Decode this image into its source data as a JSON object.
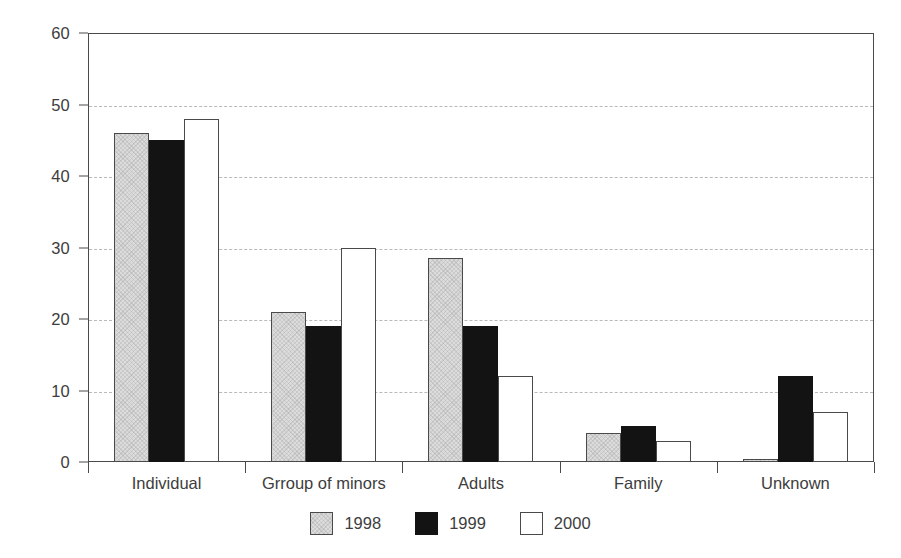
{
  "chart_data": {
    "type": "bar",
    "title": "",
    "subtitle": "",
    "xlabel": "",
    "ylabel": "",
    "categories": [
      "Individual",
      "Grroup of minors",
      "Adults",
      "Family",
      "Unknown"
    ],
    "series": [
      {
        "name": "1998",
        "color": "#dcdcdc",
        "values": [
          46,
          21,
          28.5,
          4,
          0.4
        ]
      },
      {
        "name": "1999",
        "color": "#131313",
        "values": [
          45,
          19,
          19,
          5,
          12
        ]
      },
      {
        "name": "2000",
        "color": "#ffffff",
        "values": [
          48,
          30,
          12,
          3,
          7
        ]
      }
    ],
    "ylim": [
      0,
      60
    ],
    "y_ticks": [
      0,
      10,
      20,
      30,
      40,
      50,
      60
    ],
    "y_tick_labels": [
      "0",
      "10",
      "20",
      "30",
      "40",
      "50",
      "60"
    ],
    "grid": true,
    "grid_style": "dashed-horizontal",
    "legend_position": "bottom-center",
    "axis_color": "#4a4a4a",
    "grid_color": "#b9b9b9",
    "text_color": "#3d3d3d",
    "background": "#ffffff"
  }
}
